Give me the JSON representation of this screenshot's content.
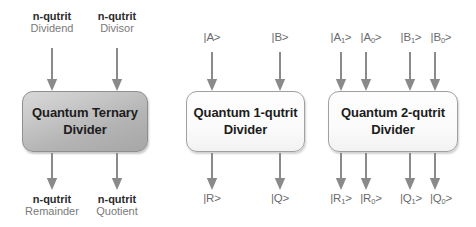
{
  "figure": {
    "type": "block-diagram",
    "background": "#ffffff",
    "accent_shaded": "#b4b4b4",
    "accent_plain": "#fbfbfb",
    "line_color": "#8a8a8a"
  },
  "blocks": [
    {
      "id": "ternary",
      "title_line1": "Quantum Ternary",
      "title_line2": "Divider",
      "style": "shaded",
      "inputs": [
        {
          "bold": "n-qutrit",
          "regular": "Dividend"
        },
        {
          "bold": "n-qutrit",
          "regular": "Divisor"
        }
      ],
      "outputs": [
        {
          "bold": "n-qutrit",
          "regular": "Remainder"
        },
        {
          "bold": "n-qutrit",
          "regular": "Quotient"
        }
      ]
    },
    {
      "id": "one-qutrit",
      "title_line1": "Quantum 1-qutrit",
      "title_line2": "Divider",
      "style": "plain",
      "inputs": [
        {
          "label": "|A>"
        },
        {
          "label": "|B>"
        }
      ],
      "outputs": [
        {
          "label": "|R>"
        },
        {
          "label": "|Q>"
        }
      ]
    },
    {
      "id": "two-qutrit",
      "title_line1": "Quantum 2-qutrit",
      "title_line2": "Divider",
      "style": "plain",
      "inputs": [
        {
          "base": "|A",
          "sub": "1",
          "tail": ">"
        },
        {
          "base": "|A",
          "sub": "0",
          "tail": ">"
        },
        {
          "base": "|B",
          "sub": "1",
          "tail": ">"
        },
        {
          "base": "|B",
          "sub": "0",
          "tail": ">"
        }
      ],
      "outputs": [
        {
          "base": "|R",
          "sub": "1",
          "tail": ">"
        },
        {
          "base": "|R",
          "sub": "0",
          "tail": ">"
        },
        {
          "base": "|Q",
          "sub": "1",
          "tail": ">"
        },
        {
          "base": "|Q",
          "sub": "0",
          "tail": ">"
        }
      ]
    }
  ]
}
